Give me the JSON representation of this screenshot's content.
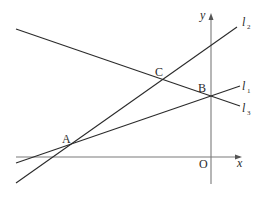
{
  "diagram": {
    "axes": {
      "x_label": "x",
      "y_label": "y",
      "origin_label": "O"
    },
    "points": [
      {
        "id": "A",
        "label": "A",
        "px": 73,
        "py": 143
      },
      {
        "id": "B",
        "label": "B",
        "px": 211,
        "py": 96
      },
      {
        "id": "C",
        "label": "C",
        "px": 162,
        "py": 79
      }
    ],
    "lines": [
      {
        "id": "l1",
        "base": "l",
        "sub": "1",
        "description": "passes through A and B"
      },
      {
        "id": "l2",
        "base": "l",
        "sub": "2",
        "description": "passes through A and C"
      },
      {
        "id": "l3",
        "base": "l",
        "sub": "3",
        "description": "passes through C and B"
      }
    ]
  }
}
